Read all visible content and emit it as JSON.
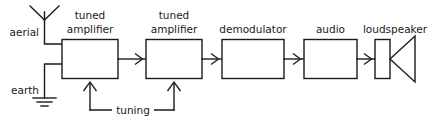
{
  "diagram": {
    "stroke_color": "#1a1a1a",
    "background_color": "#ffffff",
    "font_size_px": 10.5,
    "labels": {
      "aerial": "aerial",
      "earth": "earth",
      "tuning": "tuning"
    },
    "blocks": [
      {
        "id": "tuned-amplifier-1",
        "line1": "tuned",
        "line2": "amplifier"
      },
      {
        "id": "tuned-amplifier-2",
        "line1": "tuned",
        "line2": "amplifier"
      },
      {
        "id": "demodulator",
        "line1": "demodulator",
        "line2": ""
      },
      {
        "id": "audio",
        "line1": "audio",
        "line2": ""
      },
      {
        "id": "loudspeaker",
        "line1": "loudspeaker",
        "line2": ""
      }
    ],
    "block_labels": {
      "tuned_amplifier_1_line1": "tuned",
      "tuned_amplifier_1_line2": "amplifier",
      "tuned_amplifier_2_line1": "tuned",
      "tuned_amplifier_2_line2": "amplifier",
      "demodulator": "demodulator",
      "audio": "audio",
      "loudspeaker": "loudspeaker"
    },
    "signal_flow": [
      "aerial",
      "tuned amplifier",
      "tuned amplifier",
      "demodulator",
      "audio",
      "loudspeaker"
    ],
    "control_signal": {
      "name": "tuning",
      "targets": [
        "tuned-amplifier-1",
        "tuned-amplifier-2"
      ]
    }
  }
}
